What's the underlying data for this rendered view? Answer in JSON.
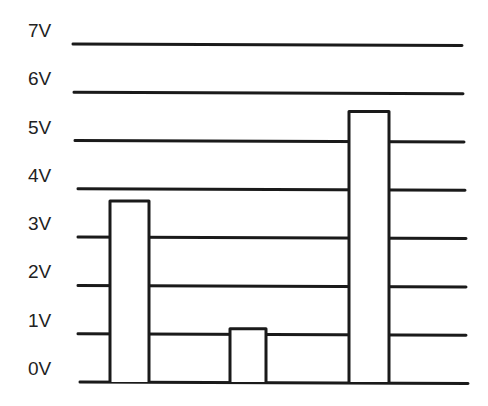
{
  "chart_data": {
    "type": "bar",
    "title": "",
    "xlabel": "",
    "ylabel": "",
    "categories": [
      "",
      "",
      ""
    ],
    "values": [
      3.75,
      1.1,
      5.6
    ],
    "ylim": [
      0,
      7
    ],
    "yticks": [
      0,
      1,
      2,
      3,
      4,
      5,
      6,
      7
    ],
    "ytick_labels": [
      "0V",
      "1V",
      "2V",
      "3V",
      "4V",
      "5V",
      "6V",
      "7V"
    ],
    "grid": true,
    "legend": "none",
    "colors": {
      "stroke": "#1a1a1a",
      "fill": "#ffffff",
      "text": "#222222"
    }
  }
}
